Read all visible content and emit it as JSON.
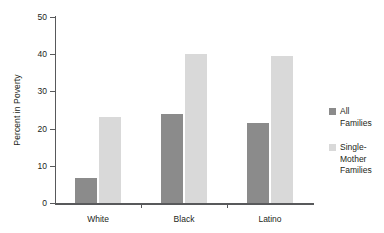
{
  "chart_data": {
    "type": "bar",
    "title": "",
    "subtitle": "",
    "xlabel": "",
    "ylabel": "Percent in Poverty",
    "categories": [
      "White",
      "Black",
      "Latino"
    ],
    "series": [
      {
        "name": "All Families",
        "color": "#8b8b8b",
        "values": [
          6.7,
          24,
          21.5
        ]
      },
      {
        "name": "Single-Mother Families",
        "color": "#d9d9d9",
        "values": [
          23,
          40,
          39.5
        ]
      }
    ],
    "ylim": [
      0,
      50
    ],
    "ytick_values": [
      0,
      10,
      20,
      30,
      40,
      50
    ],
    "ytick_labels": [
      "0",
      "10",
      "20",
      "30",
      "40",
      "50"
    ],
    "grid": false,
    "legend_position": "right",
    "legend_entries": [
      {
        "label": "All\nFamilies",
        "color": "#8b8b8b"
      },
      {
        "label": "Single-\nMother\nFamilies",
        "color": "#d9d9d9"
      }
    ]
  }
}
